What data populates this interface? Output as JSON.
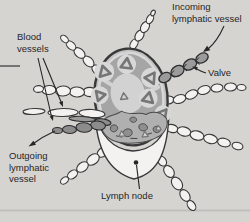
{
  "colors": {
    "bg": "#d5d4d1",
    "ink": "#262626",
    "line": "#383838",
    "white": "#f3f2f0",
    "capsule": "#c2c2c2",
    "cortex": "#a5a5a5",
    "follicle": "#d8d8d8",
    "tri": "#767676",
    "tri-fill": "#d2d2d2",
    "medulla": "#b0b0b0",
    "medulla-dark": "#8f8f8f",
    "vessel-gray": "#9b9b9b",
    "blood": "#8c8c8c",
    "shadow": "#b6b5b2"
  },
  "diagram": {
    "labels": {
      "incoming": "Incoming lymphatic vessel",
      "blood": "Blood vessels",
      "valve": "Valve",
      "outgoing": "Outgoing lymphatic vessel",
      "lymph_node": "Lymph node"
    }
  }
}
